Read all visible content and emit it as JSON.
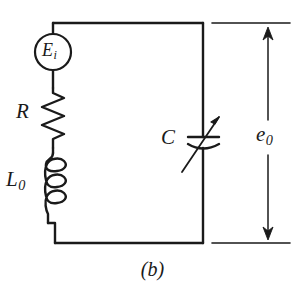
{
  "figure": {
    "caption": "(b)",
    "type": "circuit-schematic",
    "ink_color": "#1a1a1a",
    "background_color": "#ffffff"
  },
  "components": {
    "source": {
      "symbol": "ac-voltage-source",
      "label_main": "E",
      "label_sub": "i",
      "shape": "circle"
    },
    "resistor": {
      "symbol": "resistor-zigzag",
      "label_main": "R",
      "label_sub": ""
    },
    "inductor": {
      "symbol": "inductor-coil",
      "label_main": "L",
      "label_sub": "0",
      "turns": 3
    },
    "capacitor": {
      "symbol": "variable-capacitor",
      "label_main": "C",
      "label_sub": "",
      "variable": true
    },
    "output": {
      "symbol": "output-voltage-arrow",
      "label_main": "e",
      "label_sub": "0"
    }
  }
}
